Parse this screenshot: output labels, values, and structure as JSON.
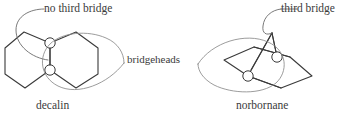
{
  "figure": {
    "type": "chemical-structure-diagram",
    "background_color": "#ffffff",
    "stroke_color": "#3a3a3a",
    "annotation_stroke_color": "#8a8a8a",
    "text_color": "#3b3b3b",
    "width": 351,
    "height": 118
  },
  "annotations": {
    "no_third_bridge": "no third bridge",
    "third_bridge": "third bridge",
    "bridgeheads": "bridgeheads"
  },
  "captions": {
    "left_structure": "decalin",
    "right_structure": "norbornane"
  },
  "structures": [
    {
      "name": "decalin",
      "caption": "decalin",
      "description": "fused bicyclic, two six-membered rings sharing one bond",
      "bridgehead_count": 2,
      "annotation": "no third bridge"
    },
    {
      "name": "norbornane",
      "caption": "norbornane",
      "description": "bridged bicyclic, six-membered ring with one-carbon bridge",
      "bridgehead_count": 2,
      "annotation": "third bridge"
    }
  ]
}
